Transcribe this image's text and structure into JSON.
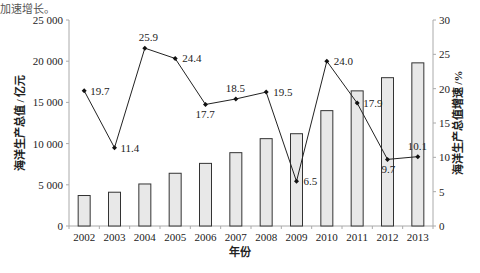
{
  "top_cut_text": "加速增长。",
  "chart_data": {
    "type": "bar+line",
    "title": "",
    "xlabel": "年份",
    "ylabel_left": "海洋生产总值 / 亿元",
    "ylabel_right": "海洋生产总值增速 /%",
    "categories": [
      "2002",
      "2003",
      "2004",
      "2005",
      "2006",
      "2007",
      "2008",
      "2009",
      "2010",
      "2011",
      "2012",
      "2013"
    ],
    "series": [
      {
        "name": "海洋生产总值",
        "type": "bar",
        "axis": "left",
        "values": [
          3700,
          4100,
          5100,
          6400,
          7600,
          8900,
          10600,
          11200,
          14000,
          16400,
          18000,
          19800
        ]
      },
      {
        "name": "海洋生产总值增速",
        "type": "line",
        "axis": "right",
        "values": [
          19.7,
          11.4,
          25.9,
          24.4,
          17.7,
          18.5,
          19.5,
          6.5,
          24.0,
          17.9,
          9.7,
          10.1
        ],
        "labels": [
          "19.7",
          "11.4",
          "25.9",
          "24.4",
          "17.7",
          "18.5",
          "19.5",
          "6.5",
          "24.0",
          "17.9",
          "9.7",
          "10.1"
        ]
      }
    ],
    "ylim_left": [
      0,
      25000
    ],
    "yticks_left": [
      0,
      5000,
      10000,
      15000,
      20000,
      25000
    ],
    "ytick_labels_left": [
      "0",
      "5 000",
      "10 000",
      "15 000",
      "20 000",
      "25 000"
    ],
    "ylim_right": [
      0,
      30
    ],
    "yticks_right": [
      0,
      5,
      10,
      15,
      20,
      25,
      30
    ],
    "ytick_labels_right": [
      "0",
      "5",
      "10",
      "15",
      "20",
      "25",
      "30"
    ],
    "grid": false,
    "legend": "none",
    "colors": {
      "bar_fill": "#e8e8e8",
      "bar_stroke": "#333333",
      "line": "#222222",
      "axis": "#aaaaaa"
    }
  }
}
